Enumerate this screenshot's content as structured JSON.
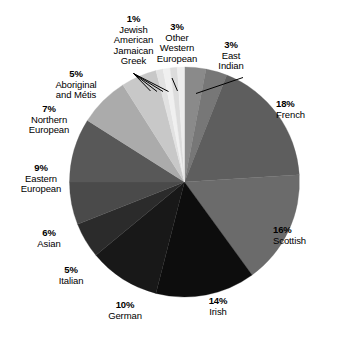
{
  "chart_data": {
    "type": "pie",
    "title": "",
    "subtitle": "",
    "xlabel": "",
    "ylabel": "",
    "legend_position": "none",
    "grid": false,
    "units": "percent",
    "total": 100,
    "start_angle_deg": 0,
    "direction": "clockwise",
    "categories": [
      "French",
      "Scottish",
      "Irish",
      "German",
      "Italian",
      "Asian",
      "Eastern European",
      "Northern European",
      "Aboriginal and Métis",
      "Greek",
      "Jamaican",
      "American",
      "Jewish",
      "Other Western European",
      "East Indian"
    ],
    "values": [
      18,
      16,
      14,
      10,
      5,
      6,
      9,
      7,
      5,
      1,
      1,
      1,
      1,
      3,
      3
    ],
    "slices": [
      {
        "label": "Other Western European",
        "percent": 3,
        "percent_text": "3%",
        "color": "#8a8a8a",
        "start_deg": 0,
        "end_deg": 10.8
      },
      {
        "label": "East Indian",
        "percent": 3,
        "percent_text": "3%",
        "color": "#777777",
        "start_deg": 10.8,
        "end_deg": 21.6
      },
      {
        "label": "French",
        "percent": 18,
        "percent_text": "18%",
        "color": "#5e5e5e",
        "start_deg": 21.6,
        "end_deg": 86.4
      },
      {
        "label": "Scottish",
        "percent": 16,
        "percent_text": "16%",
        "color": "#6b6b6b",
        "start_deg": 86.4,
        "end_deg": 144.0
      },
      {
        "label": "Irish",
        "percent": 14,
        "percent_text": "14%",
        "color": "#0d0d0d",
        "start_deg": 144.0,
        "end_deg": 194.4
      },
      {
        "label": "German",
        "percent": 10,
        "percent_text": "10%",
        "color": "#181818",
        "start_deg": 194.4,
        "end_deg": 230.4
      },
      {
        "label": "Italian",
        "percent": 5,
        "percent_text": "5%",
        "color": "#2b2b2b",
        "start_deg": 230.4,
        "end_deg": 248.4
      },
      {
        "label": "Asian",
        "percent": 6,
        "percent_text": "6%",
        "color": "#4a4a4a",
        "start_deg": 248.4,
        "end_deg": 270.0
      },
      {
        "label": "Eastern European",
        "percent": 9,
        "percent_text": "9%",
        "color": "#585858",
        "start_deg": 270.0,
        "end_deg": 302.4
      },
      {
        "label": "Northern European",
        "percent": 7,
        "percent_text": "7%",
        "color": "#ababab",
        "start_deg": 302.4,
        "end_deg": 327.6
      },
      {
        "label": "Aboriginal and Métis",
        "percent": 5,
        "percent_text": "5%",
        "color": "#c8c8c8",
        "start_deg": 327.6,
        "end_deg": 345.6
      },
      {
        "label": "Greek",
        "percent": 1,
        "percent_text": "1%",
        "color": "#e2e2e2",
        "start_deg": 345.6,
        "end_deg": 349.2
      },
      {
        "label": "Jamaican",
        "percent": 1,
        "percent_text": "1%",
        "color": "#f0f0f0",
        "start_deg": 349.2,
        "end_deg": 352.8
      },
      {
        "label": "American",
        "percent": 1,
        "percent_text": "1%",
        "color": "#dcdcdc",
        "start_deg": 352.8,
        "end_deg": 356.4
      },
      {
        "label": "Jewish",
        "percent": 1,
        "percent_text": "1%",
        "color": "#ededed",
        "start_deg": 356.4,
        "end_deg": 360.0
      }
    ],
    "annotations": [
      {
        "id": "tiny-group",
        "percent_text": "1%",
        "names": [
          "Jewish",
          "American",
          "Jamaican",
          "Greek"
        ]
      }
    ]
  },
  "labels": {
    "tiny_group": {
      "pct": "1%",
      "line1": "Jewish",
      "line2": "American",
      "line3": "Jamaican",
      "line4": "Greek"
    },
    "other_western_european": {
      "pct": "3%",
      "line1": "Other",
      "line2": "Western",
      "line3": "European"
    },
    "east_indian": {
      "pct": "3%",
      "line1": "East",
      "line2": "Indian"
    },
    "french": {
      "pct": "18%",
      "line1": "French"
    },
    "scottish": {
      "pct": "16%",
      "line1": "Scottish"
    },
    "irish": {
      "pct": "14%",
      "line1": "Irish"
    },
    "german": {
      "pct": "10%",
      "line1": "German"
    },
    "italian": {
      "pct": "5%",
      "line1": "Italian"
    },
    "asian": {
      "pct": "6%",
      "line1": "Asian"
    },
    "eastern_european": {
      "pct": "9%",
      "line1": "Eastern",
      "line2": "European"
    },
    "northern_european": {
      "pct": "7%",
      "line1": "Northern",
      "line2": "European"
    },
    "aboriginal": {
      "pct": "5%",
      "line1": "Aboriginal",
      "line2": "and Métis"
    }
  },
  "colors": {
    "background": "#ffffff",
    "text": "#000000",
    "leader_line": "#000000"
  }
}
